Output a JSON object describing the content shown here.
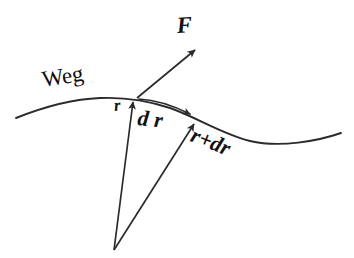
{
  "figure": {
    "type": "vector-diagram",
    "title_visible": false,
    "background_color": "#ffffff",
    "stroke_color": "#2b2b2b",
    "text_color": "#111111",
    "width": 354,
    "height": 258,
    "labels": {
      "path": "Weg",
      "force": "F",
      "position_vector": "r",
      "displacement": "d r",
      "position_vector_end": "r+dr"
    },
    "elements": {
      "path_curve_name": "Weg",
      "origin_point": "common vector origin",
      "point_start": "r",
      "point_end": "r+dr"
    }
  },
  "geometry": {
    "curve_start": [
      16,
      118
    ],
    "curve_crest": [
      100,
      98
    ],
    "point_p": [
      137,
      98
    ],
    "point_q": [
      197,
      120
    ],
    "curve_trough": [
      275,
      142
    ],
    "curve_end": [
      341,
      133
    ],
    "origin": [
      114,
      250
    ],
    "force_tip": [
      196,
      48
    ]
  }
}
